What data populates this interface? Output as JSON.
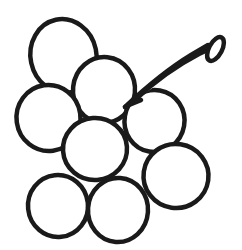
{
  "artwork": {
    "title": "Grape Bunch Line Drawing",
    "subject": "grapes",
    "style": "black outline coloring-book line art",
    "canvas": {
      "width": 242,
      "height": 250
    },
    "colors": {
      "background": "#ffffff",
      "stroke": "#1a1a1a",
      "fill": "#ffffff"
    },
    "stroke_width": 4.5,
    "berry_count": 8,
    "stem_count": 1,
    "berries": [
      {
        "name": "berry-top-left",
        "label": "Top left grape",
        "cx": 63.5,
        "cy": 56,
        "rx": 33,
        "ry": 37,
        "rotate": -12
      },
      {
        "name": "berry-top-center",
        "label": "Top center grape",
        "cx": 104,
        "cy": 90,
        "rx": 31,
        "ry": 33,
        "rotate": 6
      },
      {
        "name": "berry-left-middle",
        "label": "Left middle grape",
        "cx": 48.5,
        "cy": 118,
        "rx": 32,
        "ry": 33,
        "rotate": -8
      },
      {
        "name": "berry-right-middle",
        "label": "Right middle grape",
        "cx": 154.5,
        "cy": 121,
        "rx": 30,
        "ry": 31,
        "rotate": 10
      },
      {
        "name": "berry-center",
        "label": "Center grape",
        "cx": 95,
        "cy": 149,
        "rx": 32,
        "ry": 31,
        "rotate": -4
      },
      {
        "name": "berry-lower-right",
        "label": "Lower right grape",
        "cx": 176,
        "cy": 176,
        "rx": 32.5,
        "ry": 32,
        "rotate": 8
      },
      {
        "name": "berry-bottom-left",
        "label": "Bottom left grape",
        "cx": 58,
        "cy": 206,
        "rx": 30,
        "ry": 31,
        "rotate": -6
      },
      {
        "name": "berry-bottom-center",
        "label": "Bottom center grape",
        "cx": 118,
        "cy": 210,
        "rx": 30,
        "ry": 32,
        "rotate": 4
      }
    ],
    "stem": {
      "name": "stem",
      "label": "Grape stem",
      "outer_path": "M 125 107 C 141 92 168 69 191 55 L 208 45",
      "inner_path": "M 136 99 C 152 84 176 66 199 54 L 212 48",
      "branch_path": "M 125 107 C 133 103 138 101 141 100",
      "tip": {
        "name": "stem-tip",
        "cx": 215.5,
        "cy": 49,
        "rx": 6.5,
        "ry": 13,
        "rotate": 28
      }
    }
  }
}
